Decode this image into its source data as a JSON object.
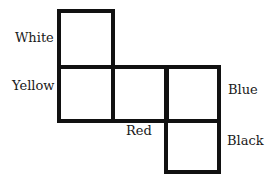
{
  "diagram": {
    "type": "cube-net",
    "faces": [
      {
        "id": "top-left",
        "label": "White"
      },
      {
        "id": "middle-left",
        "label": "Yellow"
      },
      {
        "id": "middle-center",
        "label": "Red"
      },
      {
        "id": "middle-right",
        "label": "Blue"
      },
      {
        "id": "bottom-right",
        "label": "Black"
      }
    ]
  }
}
